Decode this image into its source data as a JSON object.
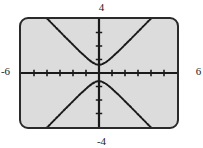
{
  "figure": {
    "kind": "graphing-calculator-screen",
    "background_color": "#ffffff",
    "screen_fill": "#dcdcdc",
    "screen_border_color": "#2a2a2a",
    "curve_color": "#1a1a1a",
    "axis_color": "#1a1a1a"
  },
  "labels": {
    "x_min": "-6",
    "x_max": "6",
    "y_max": "4",
    "y_min": "-4"
  },
  "chart_data": {
    "type": "line",
    "title": "",
    "subtitle": "",
    "xlabel": "",
    "ylabel": "",
    "grid": false,
    "legend": false,
    "legend_position": "none",
    "xlim": [
      -6,
      6
    ],
    "ylim": [
      -4,
      4
    ],
    "x_tick_labels": [
      "-6",
      "6"
    ],
    "y_tick_labels": [
      "-4",
      "4"
    ],
    "x_ticks": [
      -5,
      -4,
      -3,
      -2,
      -1,
      1,
      2,
      3,
      4,
      5
    ],
    "y_ticks": [
      -3,
      -2,
      -1,
      1,
      2,
      3
    ],
    "axis_style": "centered-cross-with-tick-marks",
    "annotations": [],
    "equation": "y^2 - x^2 = 0.36",
    "series": [
      {
        "name": "upper branch",
        "x": [
          -6,
          -5.5,
          -5,
          -4.5,
          -4,
          -3.5,
          -3,
          -2.5,
          -2,
          -1.5,
          -1,
          -0.75,
          -0.5,
          -0.25,
          0,
          0.25,
          0.5,
          0.75,
          1,
          1.5,
          2,
          2.5,
          3,
          3.5,
          4,
          4.5,
          5,
          5.5,
          6
        ],
        "y": [
          6.03,
          5.53,
          5.04,
          4.54,
          4.04,
          3.55,
          3.06,
          2.57,
          2.09,
          1.61,
          1.17,
          0.96,
          0.78,
          0.65,
          0.6,
          0.65,
          0.78,
          0.96,
          1.17,
          1.61,
          2.09,
          2.57,
          3.06,
          3.55,
          4.04,
          4.54,
          5.04,
          5.53,
          6.03
        ]
      },
      {
        "name": "lower branch",
        "x": [
          -6,
          -5.5,
          -5,
          -4.5,
          -4,
          -3.5,
          -3,
          -2.5,
          -2,
          -1.5,
          -1,
          -0.75,
          -0.5,
          -0.25,
          0,
          0.25,
          0.5,
          0.75,
          1,
          1.5,
          2,
          2.5,
          3,
          3.5,
          4,
          4.5,
          5,
          5.5,
          6
        ],
        "y": [
          -6.03,
          -5.53,
          -5.04,
          -4.54,
          -4.04,
          -3.55,
          -3.06,
          -2.57,
          -2.09,
          -1.61,
          -1.17,
          -0.96,
          -0.78,
          -0.65,
          -0.6,
          -0.65,
          -0.78,
          -0.96,
          -1.17,
          -1.61,
          -2.09,
          -2.57,
          -3.06,
          -3.55,
          -4.04,
          -4.54,
          -5.04,
          -5.53,
          -6.03
        ]
      }
    ]
  }
}
